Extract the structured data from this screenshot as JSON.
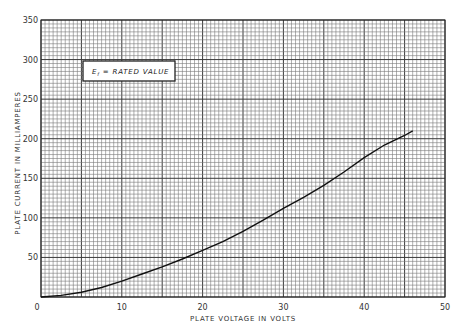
{
  "chart_data": {
    "type": "line",
    "title": "",
    "xlabel": "PLATE VOLTAGE IN VOLTS",
    "ylabel": "PLATE CURRENT IN MILLIAMPERES",
    "xlim": [
      0,
      50
    ],
    "ylim": [
      0,
      350
    ],
    "x_ticks": [
      0,
      10,
      20,
      30,
      40,
      50
    ],
    "y_ticks": [
      50,
      100,
      150,
      200,
      250,
      300,
      350
    ],
    "grid": true,
    "grid_minor_x_step": 0.5,
    "grid_minor_y_step": 5,
    "grid_major_x_step": 5,
    "grid_major_y_step": 50,
    "annotation": "Ef = RATED VALUE",
    "series": [
      {
        "name": "Plate characteristic (Ef = rated value)",
        "x": [
          0,
          2.5,
          5,
          7.5,
          10,
          12.5,
          15,
          17.5,
          20,
          22.5,
          25,
          27.5,
          30,
          32.5,
          35,
          37.5,
          40,
          42.5,
          45,
          46
        ],
        "y": [
          0,
          2,
          6,
          12,
          20,
          29,
          38,
          48,
          59,
          70,
          83,
          97,
          112,
          126,
          141,
          158,
          176,
          192,
          204,
          210
        ]
      }
    ]
  },
  "axis": {
    "xlabel": "PLATE VOLTAGE IN VOLTS",
    "ylabel": "PLATE CURRENT IN MILLIAMPERES",
    "x_tick_labels": [
      "0",
      "10",
      "20",
      "30",
      "40",
      "50"
    ],
    "y_tick_labels": [
      "50",
      "100",
      "150",
      "200",
      "250",
      "300",
      "350"
    ]
  },
  "legend": {
    "symbol": "E",
    "subscript": "f",
    "text": " = RATED VALUE"
  },
  "colors": {
    "grid_minor": "#7a7a7a",
    "grid_major": "#3a3a3a",
    "curve": "#111111",
    "background": "#ffffff"
  }
}
